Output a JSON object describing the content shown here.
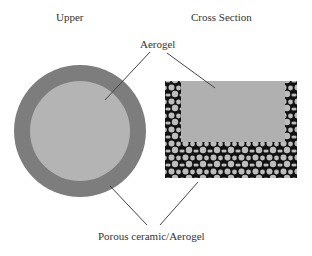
{
  "titles": {
    "upper": "Upper",
    "cross_section": "Cross Section"
  },
  "labels": {
    "aerogel": "Aerogel",
    "porous": "Porous ceramic/Aerogel"
  },
  "colors": {
    "outer_ring": "#7d7d7d",
    "inner_disc": "#b4b4b4",
    "pore_matrix": "#111111",
    "pore_particle": "#bdbdbd",
    "aerogel_fill": "#b0b0b0",
    "leader_line": "#444444"
  }
}
